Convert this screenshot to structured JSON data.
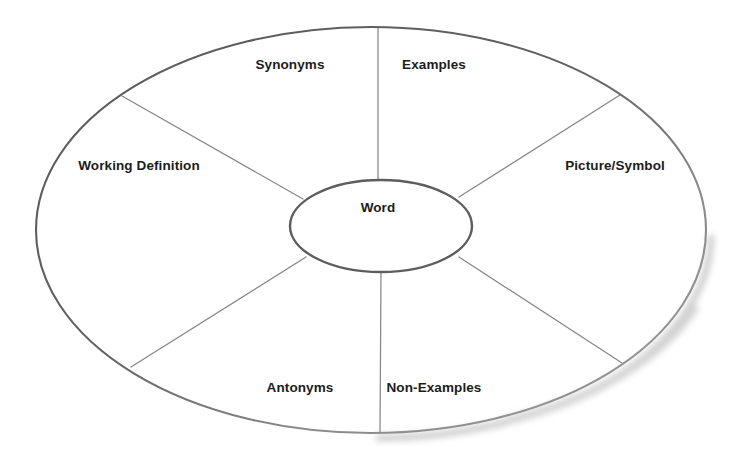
{
  "diagram": {
    "type": "word-wheel",
    "center": {
      "label": "Word"
    },
    "sectors": [
      {
        "id": "synonyms",
        "label": "Synonyms",
        "position": "top-left",
        "label_x": 290,
        "label_y": 65
      },
      {
        "id": "examples",
        "label": "Examples",
        "position": "top-right",
        "label_x": 434,
        "label_y": 65
      },
      {
        "id": "working-definition",
        "label": "Working Definition",
        "position": "left",
        "label_x": 139,
        "label_y": 166
      },
      {
        "id": "picture-symbol",
        "label": "Picture/Symbol",
        "position": "right",
        "label_x": 615,
        "label_y": 166
      },
      {
        "id": "antonyms",
        "label": "Antonyms",
        "position": "bottom-left",
        "label_x": 300,
        "label_y": 388
      },
      {
        "id": "non-examples",
        "label": "Non-Examples",
        "position": "bottom-right",
        "label_x": 434,
        "label_y": 388
      }
    ],
    "colors": {
      "background": "#ffffff",
      "outer_stroke": "#595959",
      "inner_stroke": "#595959",
      "spoke_stroke": "#808080",
      "text": "#1c1c1c",
      "shadow": "#bdbdbd"
    },
    "geometry": {
      "outer_ellipse": {
        "cx": 371,
        "cy": 230,
        "rx": 335,
        "ry": 203
      },
      "inner_ellipse": {
        "cx": 381,
        "cy": 226,
        "rx": 91,
        "ry": 46
      },
      "spokes": [
        {
          "id": "spoke-top",
          "x1": 378,
          "y1": 180,
          "x2": 378,
          "y2": 27
        },
        {
          "id": "spoke-bottom",
          "x1": 381,
          "y1": 272,
          "x2": 380,
          "y2": 433
        },
        {
          "id": "spoke-upper-left",
          "x1": 302,
          "y1": 198,
          "x2": 122,
          "y2": 96
        },
        {
          "id": "spoke-upper-right",
          "x1": 458,
          "y1": 196,
          "x2": 620,
          "y2": 95
        },
        {
          "id": "spoke-lower-left",
          "x1": 305,
          "y1": 258,
          "x2": 131,
          "y2": 367
        },
        {
          "id": "spoke-lower-right",
          "x1": 458,
          "y1": 258,
          "x2": 622,
          "y2": 363
        }
      ]
    }
  }
}
